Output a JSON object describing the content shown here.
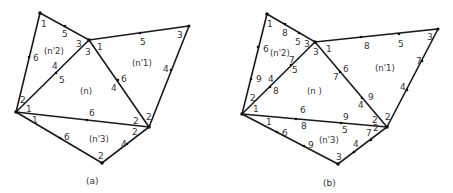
{
  "figure": {
    "panels": [
      {
        "caption": "(a)",
        "element_labels": {
          "center": "(n)",
          "n1": "(n'1)",
          "n2": "(n'2)",
          "n3": "(n'3)"
        },
        "node_labels": [
          {
            "text": "1",
            "x": 41,
            "y": 27
          },
          {
            "text": "5",
            "x": 62,
            "y": 37
          },
          {
            "text": "3",
            "x": 76,
            "y": 47
          },
          {
            "text": "3",
            "x": 85,
            "y": 55
          },
          {
            "text": "1",
            "x": 97,
            "y": 50
          },
          {
            "text": "6",
            "x": 33,
            "y": 61
          },
          {
            "text": "4",
            "x": 52,
            "y": 69
          },
          {
            "text": "5",
            "x": 59,
            "y": 83
          },
          {
            "text": "2",
            "x": 20,
            "y": 103
          },
          {
            "text": "1",
            "x": 26,
            "y": 112
          },
          {
            "text": "5",
            "x": 140,
            "y": 45
          },
          {
            "text": "3",
            "x": 177,
            "y": 38
          },
          {
            "text": "4",
            "x": 163,
            "y": 72
          },
          {
            "text": "6",
            "x": 121,
            "y": 82
          },
          {
            "text": "4",
            "x": 111,
            "y": 91
          },
          {
            "text": "6",
            "x": 89,
            "y": 116
          },
          {
            "text": "2",
            "x": 133,
            "y": 124
          },
          {
            "text": "2",
            "x": 146,
            "y": 120
          },
          {
            "text": "1",
            "x": 32,
            "y": 123
          },
          {
            "text": "6",
            "x": 64,
            "y": 140
          },
          {
            "text": "2",
            "x": 132,
            "y": 135
          },
          {
            "text": "4",
            "x": 121,
            "y": 147
          },
          {
            "text": "2",
            "x": 98,
            "y": 159
          }
        ]
      },
      {
        "caption": "(b)",
        "element_labels": {
          "center": "(n )",
          "n1": "(n'1)",
          "n2": "(n'2)",
          "n3": "(n'3)"
        },
        "node_labels": [
          {
            "text": "1",
            "x": 267,
            "y": 27
          },
          {
            "text": "8",
            "x": 282,
            "y": 36
          },
          {
            "text": "5",
            "x": 295,
            "y": 45
          },
          {
            "text": "3",
            "x": 304,
            "y": 47
          },
          {
            "text": "3",
            "x": 313,
            "y": 55
          },
          {
            "text": "1",
            "x": 326,
            "y": 52
          },
          {
            "text": "6",
            "x": 263,
            "y": 52
          },
          {
            "text": "7",
            "x": 289,
            "y": 63
          },
          {
            "text": "5",
            "x": 292,
            "y": 73
          },
          {
            "text": "9",
            "x": 256,
            "y": 82
          },
          {
            "text": "4",
            "x": 268,
            "y": 82
          },
          {
            "text": "8",
            "x": 273,
            "y": 94
          },
          {
            "text": "2",
            "x": 250,
            "y": 101
          },
          {
            "text": "1",
            "x": 253,
            "y": 112
          },
          {
            "text": "8",
            "x": 364,
            "y": 49
          },
          {
            "text": "5",
            "x": 398,
            "y": 47
          },
          {
            "text": "3",
            "x": 427,
            "y": 40
          },
          {
            "text": "7",
            "x": 416,
            "y": 64
          },
          {
            "text": "4",
            "x": 400,
            "y": 90
          },
          {
            "text": "6",
            "x": 343,
            "y": 72
          },
          {
            "text": "7",
            "x": 333,
            "y": 80
          },
          {
            "text": "9",
            "x": 368,
            "y": 100
          },
          {
            "text": "4",
            "x": 358,
            "y": 108
          },
          {
            "text": "6",
            "x": 300,
            "y": 113
          },
          {
            "text": "9",
            "x": 343,
            "y": 120
          },
          {
            "text": "2",
            "x": 372,
            "y": 123
          },
          {
            "text": "2",
            "x": 385,
            "y": 120
          },
          {
            "text": "8",
            "x": 301,
            "y": 129
          },
          {
            "text": "5",
            "x": 342,
            "y": 133
          },
          {
            "text": "1",
            "x": 266,
            "y": 125
          },
          {
            "text": "6",
            "x": 282,
            "y": 136
          },
          {
            "text": "9",
            "x": 308,
            "y": 148
          },
          {
            "text": "7",
            "x": 366,
            "y": 136
          },
          {
            "text": "2",
            "x": 373,
            "y": 131
          },
          {
            "text": "4",
            "x": 353,
            "y": 147
          },
          {
            "text": "3",
            "x": 336,
            "y": 160
          }
        ]
      }
    ]
  }
}
